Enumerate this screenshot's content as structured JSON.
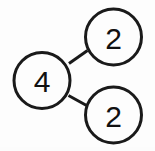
{
  "diagram": {
    "type": "factor-tree",
    "background_color": "#fdfdfd",
    "stroke_color": "#1a1a1a",
    "text_color": "#111111",
    "stroke_width": 3,
    "canvas": {
      "width": 155,
      "height": 151
    },
    "nodes": [
      {
        "id": "root",
        "label": "4",
        "role": "composite-number",
        "cx": 42,
        "cy": 80.5,
        "r": 28
      },
      {
        "id": "factor-top",
        "label": "2",
        "role": "prime-factor",
        "cx": 113.5,
        "cy": 37,
        "r": 28
      },
      {
        "id": "factor-bottom",
        "label": "2",
        "role": "prime-factor",
        "cx": 113.5,
        "cy": 115,
        "r": 28
      }
    ],
    "edges": [
      {
        "id": "edge-root-top",
        "from": "root",
        "to": "factor-top",
        "x1": 69,
        "y1": 63.5,
        "x2": 87.5,
        "y2": 50.5
      },
      {
        "id": "edge-root-bottom",
        "from": "root",
        "to": "factor-bottom",
        "x1": 68.5,
        "y1": 95.5,
        "x2": 87.5,
        "y2": 106
      }
    ]
  }
}
